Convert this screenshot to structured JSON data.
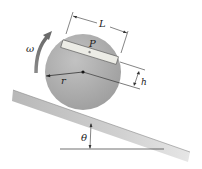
{
  "diagram": {
    "type": "physics-mechanics",
    "labels": {
      "omega": "ω",
      "length": "L",
      "plate": "P",
      "radius": "r",
      "height": "h",
      "angle": "θ"
    },
    "colors": {
      "disk": "#a8a8a8",
      "disk_highlight": "#c4c4c4",
      "plate": "#e8e8e2",
      "incline": "#bdbdbd",
      "incline_light": "#e0e0e0",
      "arrow": "#7a7a7a",
      "line": "#222222"
    }
  }
}
